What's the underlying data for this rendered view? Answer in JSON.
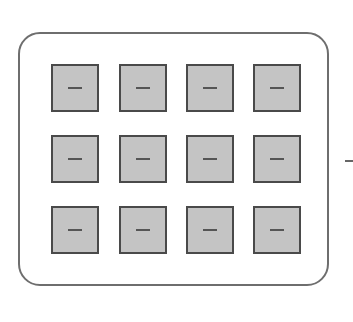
{
  "diagram": {
    "frame": {
      "shape": "rounded-rectangle",
      "border_color": "#6e6e6e"
    },
    "grid": {
      "rows": 3,
      "cols": 4
    },
    "tile_style": {
      "fill": "#c4c4c4",
      "border": "#4a4a4a",
      "glyph": "minus"
    },
    "tiles": [
      {
        "row": 0,
        "col": 0,
        "glyph": "minus"
      },
      {
        "row": 0,
        "col": 1,
        "glyph": "minus"
      },
      {
        "row": 0,
        "col": 2,
        "glyph": "minus"
      },
      {
        "row": 0,
        "col": 3,
        "glyph": "minus"
      },
      {
        "row": 1,
        "col": 0,
        "glyph": "minus"
      },
      {
        "row": 1,
        "col": 1,
        "glyph": "minus"
      },
      {
        "row": 1,
        "col": 2,
        "glyph": "minus"
      },
      {
        "row": 1,
        "col": 3,
        "glyph": "minus"
      },
      {
        "row": 2,
        "col": 0,
        "glyph": "minus"
      },
      {
        "row": 2,
        "col": 1,
        "glyph": "minus"
      },
      {
        "row": 2,
        "col": 2,
        "glyph": "minus"
      },
      {
        "row": 2,
        "col": 3,
        "glyph": "minus"
      }
    ],
    "side_mark": {
      "glyph": "minus"
    }
  }
}
